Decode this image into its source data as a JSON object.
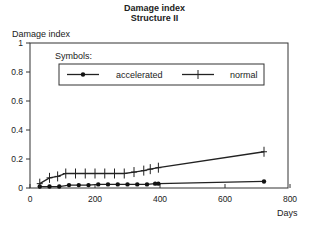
{
  "chart_data": {
    "type": "line",
    "title": "Damage index",
    "subtitle": "Structure II",
    "xlabel": "Days",
    "ylabel": "Damage index",
    "xlim": [
      0,
      800
    ],
    "ylim": [
      0,
      1
    ],
    "xticks": [
      0,
      200,
      400,
      600,
      800
    ],
    "yticks": [
      0,
      0.2,
      0.4,
      0.6,
      0.8,
      1
    ],
    "ytick_labels": [
      "0",
      "0.2",
      "0.4",
      "0.6",
      "0.8",
      "1"
    ],
    "grid": false,
    "legend": {
      "title": "Symbols:",
      "position": "upper inside",
      "entries": [
        "accelerated",
        "normal"
      ]
    },
    "series": [
      {
        "name": "accelerated",
        "marker": "dot",
        "x": [
          30,
          60,
          90,
          120,
          150,
          180,
          210,
          240,
          270,
          300,
          330,
          360,
          385,
          395,
          720
        ],
        "y": [
          0.01,
          0.01,
          0.01,
          0.02,
          0.02,
          0.02,
          0.025,
          0.025,
          0.025,
          0.025,
          0.025,
          0.025,
          0.03,
          0.03,
          0.045
        ]
      },
      {
        "name": "normal",
        "marker": "plus",
        "x": [
          30,
          60,
          85,
          110,
          140,
          170,
          200,
          230,
          260,
          290,
          320,
          350,
          370,
          395,
          720
        ],
        "y": [
          0.03,
          0.07,
          0.08,
          0.1,
          0.1,
          0.1,
          0.1,
          0.1,
          0.1,
          0.1,
          0.11,
          0.12,
          0.13,
          0.14,
          0.25
        ]
      }
    ]
  }
}
